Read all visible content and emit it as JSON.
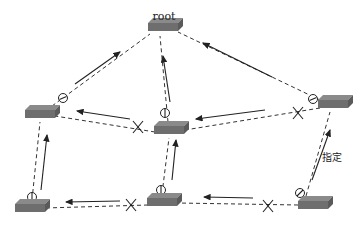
{
  "diagram": {
    "type": "spanning-tree-topology",
    "labels": {
      "root": "root",
      "designated": "指定"
    },
    "colors": {
      "switch_top": "#8a8a8a",
      "switch_front": "#6e6e6e",
      "switch_side": "#5a5a5a",
      "line": "#333333"
    },
    "switches": [
      {
        "id": "root",
        "label": "root"
      },
      {
        "id": "left-mid"
      },
      {
        "id": "center"
      },
      {
        "id": "right-mid"
      },
      {
        "id": "bottom-left"
      },
      {
        "id": "bottom-center"
      },
      {
        "id": "bottom-right"
      }
    ],
    "links": [
      {
        "from": "left-mid",
        "to": "root",
        "port_state": "forwarding",
        "port_symbol": "circle"
      },
      {
        "from": "center",
        "to": "root",
        "port_state": "forwarding",
        "port_symbol": "circle"
      },
      {
        "from": "right-mid",
        "to": "root",
        "port_state": "forwarding",
        "port_symbol": "circle"
      },
      {
        "from": "center",
        "to": "left-mid",
        "port_state": "blocked",
        "port_symbol": "x"
      },
      {
        "from": "right-mid",
        "to": "center",
        "port_state": "blocked",
        "port_symbol": "x"
      },
      {
        "from": "bottom-left",
        "to": "left-mid",
        "port_state": "forwarding",
        "port_symbol": "circle"
      },
      {
        "from": "bottom-center",
        "to": "center",
        "port_state": "forwarding",
        "port_symbol": "circle"
      },
      {
        "from": "bottom-right",
        "to": "right-mid",
        "port_state": "forwarding",
        "port_symbol": "circle",
        "annotation": "指定"
      },
      {
        "from": "bottom-center",
        "to": "bottom-left",
        "port_state": "blocked",
        "port_symbol": "x"
      },
      {
        "from": "bottom-right",
        "to": "bottom-center",
        "port_state": "blocked",
        "port_symbol": "x"
      }
    ]
  }
}
